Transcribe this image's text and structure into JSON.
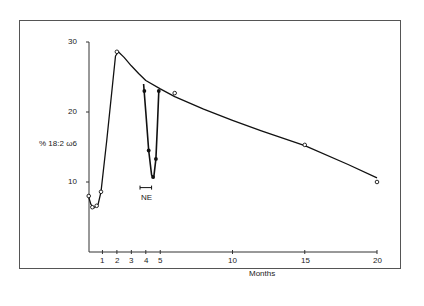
{
  "chart_data": {
    "type": "line",
    "title": "",
    "xlabel": "Months",
    "ylabel": "% 18:2 ω6",
    "xlim": [
      0,
      20
    ],
    "ylim": [
      0,
      30
    ],
    "x_ticks": [
      1,
      2,
      3,
      4,
      5,
      10,
      15,
      20
    ],
    "y_ticks": [
      10,
      20,
      30
    ],
    "grid": false,
    "legend": null,
    "annotations": [
      {
        "text": "NE",
        "x_range": [
          3.6,
          4.4
        ],
        "y": 9.2,
        "note": "bar marking period of NE"
      }
    ],
    "series": [
      {
        "name": "open circles (main trend)",
        "marker": "open-circle",
        "points": [
          [
            0.05,
            8.0
          ],
          [
            0.3,
            6.4
          ],
          [
            0.6,
            6.6
          ],
          [
            0.9,
            8.6
          ],
          [
            2.0,
            28.6
          ],
          [
            6.0,
            22.7
          ],
          [
            15.0,
            15.3
          ],
          [
            20.0,
            10.0
          ]
        ],
        "curve": [
          [
            0.0,
            8.2
          ],
          [
            0.2,
            6.8
          ],
          [
            0.4,
            6.3
          ],
          [
            0.7,
            6.8
          ],
          [
            0.9,
            8.6
          ],
          [
            1.3,
            16.0
          ],
          [
            1.7,
            24.0
          ],
          [
            1.9,
            28.0
          ],
          [
            2.1,
            28.6
          ],
          [
            2.5,
            27.8
          ],
          [
            3.0,
            26.6
          ],
          [
            3.5,
            25.5
          ],
          [
            4.0,
            24.5
          ],
          [
            5.0,
            23.3
          ],
          [
            6.0,
            22.2
          ],
          [
            8.0,
            20.4
          ],
          [
            10.0,
            18.8
          ],
          [
            12.0,
            17.3
          ],
          [
            15.0,
            15.2
          ],
          [
            18.0,
            12.5
          ],
          [
            20.0,
            10.6
          ]
        ]
      },
      {
        "name": "filled circles (NE treatment)",
        "marker": "filled-circle",
        "points": [
          [
            3.9,
            23.0
          ],
          [
            4.2,
            14.5
          ],
          [
            4.5,
            10.7
          ],
          [
            4.7,
            13.3
          ],
          [
            4.9,
            23.0
          ]
        ],
        "curve": [
          [
            3.85,
            24.0
          ],
          [
            4.0,
            20.0
          ],
          [
            4.2,
            14.5
          ],
          [
            4.4,
            11.0
          ],
          [
            4.55,
            10.6
          ],
          [
            4.7,
            13.3
          ],
          [
            4.8,
            18.0
          ],
          [
            4.9,
            23.0
          ]
        ]
      }
    ]
  },
  "labels": {
    "y_axis_label": "% 18:2 ω6",
    "x_axis_label": "Months",
    "annotation_ne": "NE",
    "y_tick_10": "10",
    "y_tick_20": "20",
    "y_tick_30": "30",
    "x_tick_1": "1",
    "x_tick_2": "2",
    "x_tick_3": "3",
    "x_tick_4": "4",
    "x_tick_5": "5",
    "x_tick_10": "10",
    "x_tick_15": "15",
    "x_tick_20": "20"
  }
}
